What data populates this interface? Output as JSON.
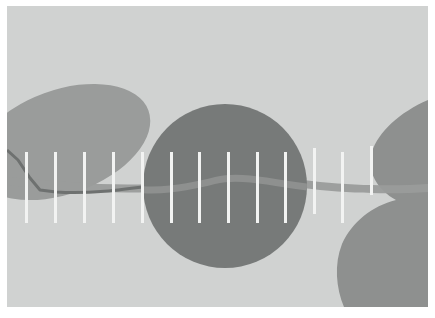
{
  "image": {
    "title": "Abstract grayscale composition",
    "width": 435,
    "height": 318,
    "background_color": "#ffffff"
  },
  "frame": {
    "name": "outer-white-border",
    "left": 7,
    "top": 6,
    "right": 428,
    "bottom": 307,
    "fill_color": "#d0d2d1"
  },
  "shapes": {
    "ellipse_top_left": {
      "label": "rotated-ellipse-upper-left",
      "cx": 62,
      "cy": 142,
      "rx": 92,
      "ry": 52,
      "rotation_deg": -20,
      "fill_color": "#9a9c9b"
    },
    "circle_center": {
      "label": "large-center-circle",
      "cx": 225,
      "cy": 186,
      "r": 82,
      "fill_color": "#777a79"
    },
    "blob_right": {
      "label": "concave-right-edge-shape",
      "fill_color": "#8e908f"
    },
    "wave_band": {
      "label": "horizontal-wave-band",
      "fill_color": "#838584",
      "thickness": 8
    },
    "line_left": {
      "label": "descending-left-line",
      "stroke_color": "#6e7170",
      "stroke_width": 3
    }
  },
  "bars": {
    "label": "white-vertical-bars",
    "color": "#f2f3f2",
    "width": 3,
    "count": 13,
    "items": [
      {
        "x": 25,
        "top": 152,
        "bottom": 223
      },
      {
        "x": 54,
        "top": 152,
        "bottom": 223
      },
      {
        "x": 83,
        "top": 152,
        "bottom": 223
      },
      {
        "x": 112,
        "top": 152,
        "bottom": 223
      },
      {
        "x": 141,
        "top": 152,
        "bottom": 223
      },
      {
        "x": 170,
        "top": 152,
        "bottom": 223
      },
      {
        "x": 198,
        "top": 152,
        "bottom": 223
      },
      {
        "x": 227,
        "top": 152,
        "bottom": 223
      },
      {
        "x": 256,
        "top": 152,
        "bottom": 223
      },
      {
        "x": 284,
        "top": 152,
        "bottom": 223
      },
      {
        "x": 313,
        "top": 148,
        "bottom": 214
      },
      {
        "x": 341,
        "top": 152,
        "bottom": 223
      },
      {
        "x": 370,
        "top": 146,
        "bottom": 195
      }
    ]
  },
  "palette": {
    "background_light": "#d0d2d1",
    "mid_gray": "#9a9c9b",
    "dark_gray": "#777a79",
    "band_gray": "#838584",
    "bar_white": "#f2f3f2",
    "page_white": "#ffffff"
  }
}
